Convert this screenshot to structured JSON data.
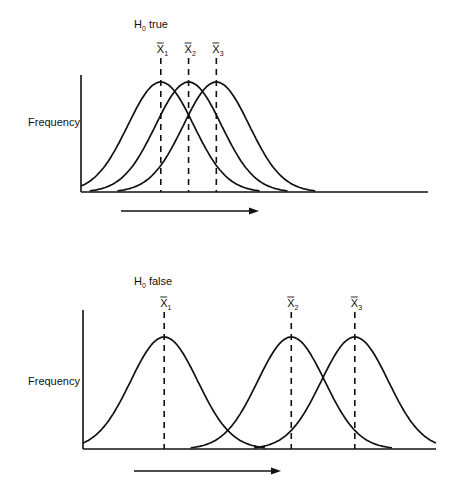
{
  "chart_data": [
    {
      "type": "line",
      "title": "H₀ true",
      "title_base": "H",
      "title_sub": "0",
      "title_rest": " true",
      "ylabel": "Frequency",
      "xlabel": "",
      "direction_arrow": "right",
      "x_range": [
        0,
        100
      ],
      "series": [
        {
          "name": "X̄₁",
          "label_base": "X",
          "label_sub": "1",
          "mean": 23,
          "sd": 9.5
        },
        {
          "name": "X̄₂",
          "label_base": "X",
          "label_sub": "2",
          "mean": 31,
          "sd": 9.5
        },
        {
          "name": "X̄₃",
          "label_base": "X",
          "label_sub": "3",
          "mean": 39,
          "sd": 9.5
        }
      ],
      "mean_markers": "dashed vertical lines",
      "grid": false,
      "legend": "none"
    },
    {
      "type": "line",
      "title": "H₀ false",
      "title_base": "H",
      "title_sub": "0",
      "title_rest": " false",
      "ylabel": "Frequency",
      "xlabel": "",
      "direction_arrow": "right",
      "x_range": [
        0,
        100
      ],
      "series": [
        {
          "name": "X̄₁",
          "label_base": "X",
          "label_sub": "1",
          "mean": 23,
          "sd": 9.5
        },
        {
          "name": "X̄₂",
          "label_base": "X",
          "label_sub": "2",
          "mean": 59,
          "sd": 9.5
        },
        {
          "name": "X̄₃",
          "label_base": "X",
          "label_sub": "3",
          "mean": 77,
          "sd": 9.5
        }
      ],
      "mean_markers": "dashed vertical lines",
      "grid": false,
      "legend": "none"
    }
  ]
}
